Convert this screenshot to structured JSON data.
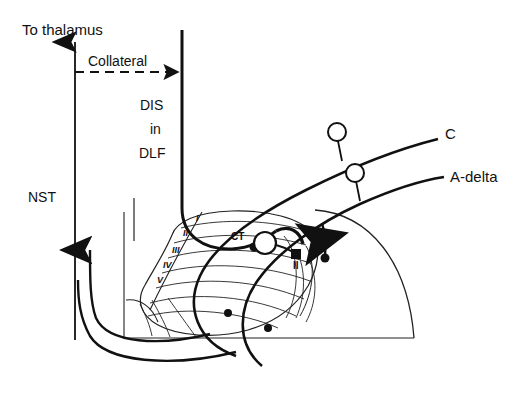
{
  "figure": {
    "stroke_color": "#111111",
    "background_color": "#ffffff",
    "thin_stroke_color": "#222222"
  },
  "labels": {
    "to_thalamus": "To thalamus",
    "collateral": "Collateral",
    "dis": "DIS",
    "in": "in",
    "dlf": "DLF",
    "nst": "NST",
    "c_fiber": "C",
    "a_delta_fiber": "A-delta",
    "ct_cell": "CT",
    "lamina_ii_cell": "II"
  },
  "laminae": {
    "label": "Rexed laminae",
    "items": [
      {
        "numeral": "I"
      },
      {
        "numeral": "II"
      },
      {
        "numeral": "III"
      },
      {
        "numeral": "IV"
      },
      {
        "numeral": "V"
      }
    ]
  },
  "markers": {
    "open_circle_label": "cell body",
    "filled_dot_label": "synaptic terminal",
    "filled_square_label": "interneuron soma"
  }
}
